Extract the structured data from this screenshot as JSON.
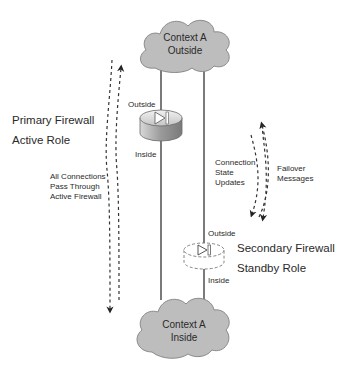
{
  "diagram": {
    "clouds": {
      "top": {
        "line1": "Context A",
        "line2": "Outside"
      },
      "bottom": {
        "line1": "Context A",
        "line2": "Inside"
      }
    },
    "primary_firewall": {
      "title_line1": "Primary Firewall",
      "title_line2": "Active Role",
      "outside_label": "Outside",
      "inside_label": "Inside",
      "traffic_note": [
        "All Connections",
        "Pass Through",
        "Active Firewall"
      ]
    },
    "secondary_firewall": {
      "title_line1": "Secondary Firewall",
      "title_line2": "Standby Role",
      "outside_label": "Outside",
      "inside_label": "Inside"
    },
    "sync_labels": {
      "connection_state": [
        "Connection",
        "State",
        "Updates"
      ],
      "failover": [
        "Failover",
        "Messages"
      ]
    },
    "colors": {
      "cloud_fill": "#bdbdbd",
      "cloud_stroke": "#8a8a8a",
      "line": "#333333",
      "firewall_body": "#a8a8a8",
      "text": "#2a2a2a"
    }
  }
}
